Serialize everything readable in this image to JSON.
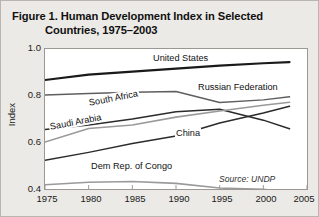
{
  "figure": {
    "title_line1": "Figure 1. Human Development Index in Selected",
    "title_line2": "Countries, 1975–2003",
    "source": "Source: UNDP"
  },
  "axes": {
    "y_title": "Index",
    "y_ticks": [
      "1.0",
      "0.8",
      "0.6",
      "0.4"
    ],
    "x_ticks": [
      "1975",
      "1980",
      "1985",
      "1990",
      "1995",
      "2000",
      "2005"
    ]
  },
  "series_labels": {
    "united_states": "United States",
    "russian_federation": "Russian Federation",
    "south_africa": "South Africa",
    "saudi_arabia": "Saudi Arabia",
    "china": "China",
    "dem_rep_congo": "Dem Rep. of Congo"
  },
  "chart_data": {
    "type": "line",
    "title": "Figure 1. Human Development Index in Selected Countries, 1975–2003",
    "xlabel": "",
    "ylabel": "Index",
    "xlim": [
      1975,
      2005
    ],
    "ylim": [
      0.4,
      1.0
    ],
    "xticks": [
      1975,
      1980,
      1985,
      1990,
      1995,
      2000,
      2005
    ],
    "yticks": [
      0.4,
      0.6,
      0.8,
      1.0
    ],
    "grid": false,
    "legend": "inline-labels",
    "source": "Source: UNDP",
    "x": [
      1975,
      1980,
      1985,
      1990,
      1995,
      2000,
      2003
    ],
    "series": [
      {
        "name": "United States",
        "color": "#1a1a1a",
        "width": 2.2,
        "values": [
          0.867,
          0.89,
          0.903,
          0.916,
          0.929,
          0.939,
          0.944
        ]
      },
      {
        "name": "Russian Federation",
        "color": "#5f5f5f",
        "width": 1.5,
        "values": [
          0.803,
          0.809,
          0.815,
          0.818,
          0.771,
          0.782,
          0.795
        ]
      },
      {
        "name": "South Africa",
        "color": "#2b2b2b",
        "width": 1.5,
        "values": [
          0.655,
          0.674,
          0.7,
          0.731,
          0.742,
          0.695,
          0.658
        ]
      },
      {
        "name": "Saudi Arabia",
        "color": "#9a9a9a",
        "width": 1.6,
        "values": [
          0.601,
          0.659,
          0.674,
          0.708,
          0.734,
          0.759,
          0.772
        ]
      },
      {
        "name": "China",
        "color": "#2b2b2b",
        "width": 1.5,
        "values": [
          0.523,
          0.557,
          0.595,
          0.627,
          0.683,
          0.726,
          0.755
        ]
      },
      {
        "name": "Dem Rep. of Congo",
        "color": "#9a9a9a",
        "width": 1.6,
        "values": [
          0.418,
          0.429,
          0.432,
          0.424,
          0.404,
          0.399,
          0.385
        ]
      }
    ]
  }
}
